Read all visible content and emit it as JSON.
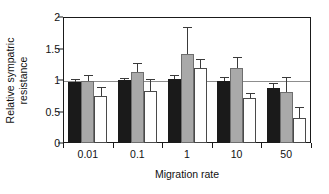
{
  "chart_data": {
    "type": "bar",
    "title": "",
    "xlabel": "Migration rate",
    "ylabel": "Relative sympatric resistance",
    "ylabel_lines": [
      "Relative sympatric",
      "resistance"
    ],
    "categories": [
      "0.01",
      "0.1",
      "1",
      "10",
      "50"
    ],
    "ylim": [
      0,
      2
    ],
    "yticks": [
      "0",
      "0.5",
      "1",
      "1.5",
      "2"
    ],
    "ytick_values": [
      0,
      0.5,
      1,
      1.5,
      2
    ],
    "grid": "horizontal reference line at y = 1",
    "reference_line": 1,
    "legend": "none",
    "series": [
      {
        "name": "black",
        "color": "#1a1a1a",
        "values": [
          0.97,
          1.0,
          1.02,
          0.99,
          0.88
        ],
        "errors": [
          0.03,
          0.02,
          0.05,
          0.04,
          0.05
        ]
      },
      {
        "name": "gray",
        "color": "#a9a9a9",
        "values": [
          0.98,
          1.13,
          1.42,
          1.19,
          0.81
        ],
        "errors": [
          0.09,
          0.13,
          0.4,
          0.16,
          0.22
        ]
      },
      {
        "name": "white",
        "color": "#ffffff",
        "values": [
          0.74,
          0.83,
          1.19,
          0.71,
          0.4
        ],
        "errors": [
          0.14,
          0.17,
          0.12,
          0.07,
          0.15
        ]
      }
    ]
  },
  "axis": {
    "frame_color": "#1a1a1a",
    "gridline_color": "#8d8d8d"
  }
}
